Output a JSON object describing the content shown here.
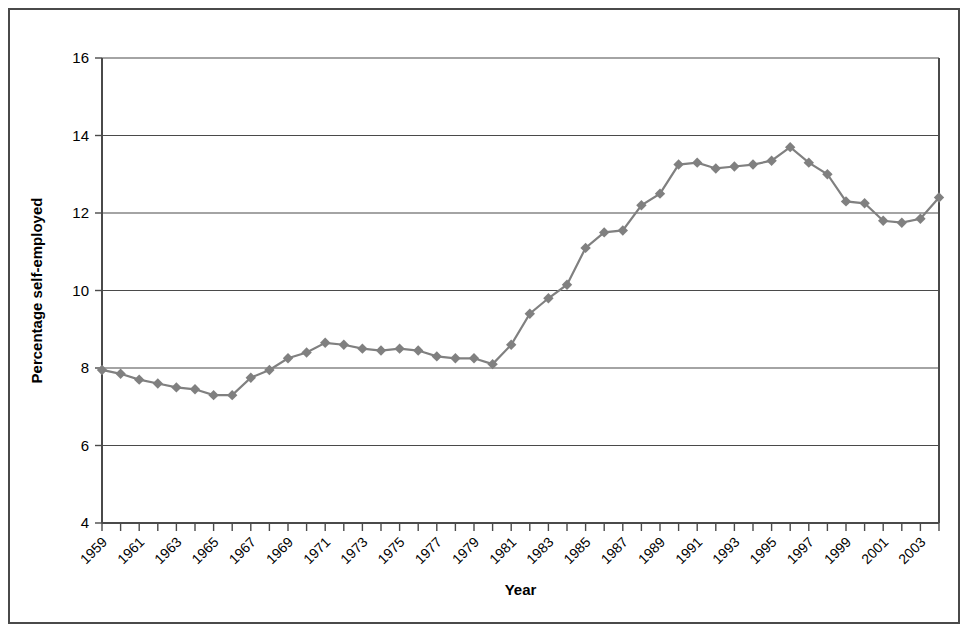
{
  "figure": {
    "border_color": "#4a4a4a",
    "background": "#ffffff"
  },
  "chart_data": {
    "type": "line",
    "title": "",
    "subtitle": "",
    "xlabel": "Year",
    "ylabel": "Percentage self-employed",
    "xlim": [
      1959,
      2004
    ],
    "ylim": [
      4,
      16
    ],
    "ytick_values": [
      4,
      6,
      8,
      10,
      12,
      14,
      16
    ],
    "ytick_labels": [
      "4",
      "6",
      "8",
      "10",
      "12",
      "14",
      "16"
    ],
    "xtick_labels": [
      "1959",
      "1961",
      "1963",
      "1965",
      "1967",
      "1969",
      "1971",
      "1973",
      "1975",
      "1977",
      "1979",
      "1981",
      "1983",
      "1985",
      "1987",
      "1989",
      "1991",
      "1993",
      "1995",
      "1997",
      "1999",
      "2001",
      "2003"
    ],
    "xtick_label_rotation": -45,
    "grid": "horizontal",
    "legend": "none",
    "marker": "diamond",
    "marker_color": "#808080",
    "line_color": "#808080",
    "x": [
      1959,
      1960,
      1961,
      1962,
      1963,
      1964,
      1965,
      1966,
      1967,
      1968,
      1969,
      1970,
      1971,
      1972,
      1973,
      1974,
      1975,
      1976,
      1977,
      1978,
      1979,
      1980,
      1981,
      1982,
      1983,
      1984,
      1985,
      1986,
      1987,
      1988,
      1989,
      1990,
      1991,
      1992,
      1993,
      1994,
      1995,
      1996,
      1997,
      1998,
      1999,
      2000,
      2001,
      2002,
      2003,
      2004
    ],
    "values": [
      7.95,
      7.85,
      7.7,
      7.6,
      7.5,
      7.45,
      7.3,
      7.3,
      7.75,
      7.95,
      8.25,
      8.4,
      8.65,
      8.6,
      8.5,
      8.45,
      8.5,
      8.45,
      8.3,
      8.25,
      8.25,
      8.1,
      8.6,
      9.4,
      9.8,
      10.15,
      11.1,
      11.5,
      11.55,
      12.2,
      12.5,
      13.25,
      13.3,
      13.15,
      13.2,
      13.25,
      13.35,
      13.7,
      13.3,
      13.0,
      12.3,
      12.25,
      11.8,
      11.75,
      11.85,
      12.4
    ],
    "series": [
      {
        "name": "Percentage self-employed",
        "values": [
          7.95,
          7.85,
          7.7,
          7.6,
          7.5,
          7.45,
          7.3,
          7.3,
          7.75,
          7.95,
          8.25,
          8.4,
          8.65,
          8.6,
          8.5,
          8.45,
          8.5,
          8.45,
          8.3,
          8.25,
          8.25,
          8.1,
          8.6,
          9.4,
          9.8,
          10.15,
          11.1,
          11.5,
          11.55,
          12.2,
          12.5,
          13.25,
          13.3,
          13.15,
          13.2,
          13.25,
          13.35,
          13.7,
          13.3,
          13.0,
          12.3,
          12.25,
          11.8,
          11.75,
          11.85,
          12.4
        ]
      }
    ]
  }
}
